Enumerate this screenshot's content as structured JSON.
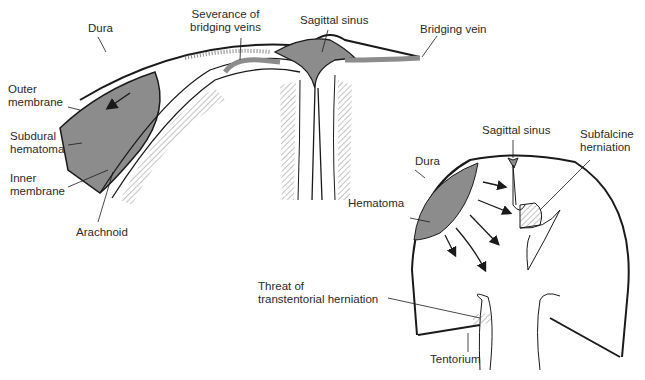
{
  "diagram": {
    "colors": {
      "hematoma_fill": "#8c8c8c",
      "line": "#1a1a1a",
      "hatch": "#999999",
      "background": "#ffffff"
    },
    "top_view": {
      "labels": {
        "dura": "Dura",
        "severance": "Severance of\nbridging veins",
        "sagittal_sinus": "Sagittal sinus",
        "bridging_vein": "Bridging vein",
        "outer_membrane": "Outer\nmembrane",
        "subdural_hematoma": "Subdural\nhematoma",
        "inner_membrane": "Inner\nmembrane",
        "arachnoid": "Arachnoid"
      }
    },
    "coronal_view": {
      "labels": {
        "sagittal_sinus": "Sagittal sinus",
        "subfalcine_herniation": "Subfalcine\nherniation",
        "dura": "Dura",
        "hematoma": "Hematoma",
        "transtentorial": "Threat of\ntranstentorial herniation",
        "tentorium": "Tentorium"
      }
    }
  }
}
